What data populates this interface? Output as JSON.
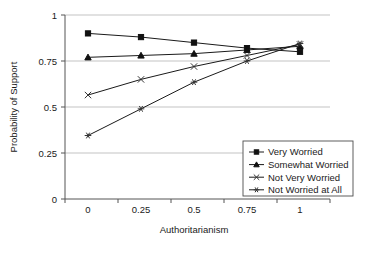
{
  "chart_data": {
    "type": "line",
    "title": "",
    "xlabel": "Authoritarianism",
    "ylabel": "Probability of Support",
    "x": [
      0,
      0.25,
      0.5,
      0.75,
      1
    ],
    "xtick_labels": [
      "0",
      "0.25",
      "0.5",
      "0.75",
      "1"
    ],
    "ytick_labels": [
      "0",
      "0.25",
      "0.5",
      "0.75",
      "1"
    ],
    "ylim": [
      0,
      1
    ],
    "xlim": [
      0,
      1
    ],
    "grid": "horizontal",
    "legend_position": "inside-bottom-right",
    "series": [
      {
        "name": "Very Worried",
        "marker": "square",
        "values": [
          0.9,
          0.88,
          0.85,
          0.82,
          0.8
        ]
      },
      {
        "name": "Somewhat Worried",
        "marker": "triangle",
        "values": [
          0.77,
          0.78,
          0.79,
          0.81,
          0.83
        ]
      },
      {
        "name": "Not Very Worried",
        "marker": "x",
        "values": [
          0.565,
          0.65,
          0.72,
          0.78,
          0.84
        ]
      },
      {
        "name": "Not Worried at All",
        "marker": "asterisk",
        "values": [
          0.345,
          0.49,
          0.635,
          0.75,
          0.845
        ]
      }
    ]
  },
  "axis": {
    "y_title": "Probability of Support",
    "x_title": "Authoritarianism",
    "y_ticks": [
      "1",
      "0.75",
      "0.5",
      "0.25",
      "0"
    ],
    "x_ticks": [
      "0",
      "0.25",
      "0.5",
      "0.75",
      "1"
    ]
  },
  "legend": {
    "entries": [
      {
        "label": "Very Worried",
        "marker": "square-marker-icon"
      },
      {
        "label": "Somewhat Worried",
        "marker": "triangle-marker-icon"
      },
      {
        "label": "Not Very Worried",
        "marker": "cross-marker-icon"
      },
      {
        "label": "Not Worried at All",
        "marker": "asterisk-marker-icon"
      }
    ]
  },
  "colors": {
    "ink": "#1a1a1a",
    "grid": "#b4b4b4",
    "axis": "#555555",
    "background": "#ffffff"
  }
}
